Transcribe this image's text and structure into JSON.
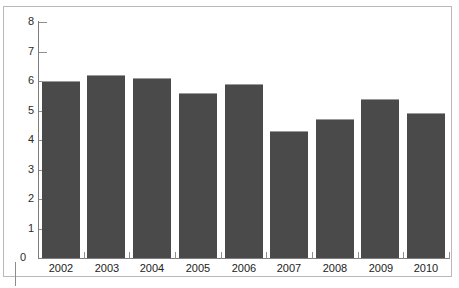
{
  "chart_data": {
    "type": "bar",
    "title": "",
    "subtitle": "",
    "xlabel": "",
    "ylabel": "",
    "categories": [
      "2002",
      "2003",
      "2004",
      "2005",
      "2006",
      "2007",
      "2008",
      "2009",
      "2010"
    ],
    "values": [
      6.0,
      6.2,
      6.1,
      5.6,
      5.9,
      4.3,
      4.7,
      5.4,
      4.9
    ],
    "ylim": [
      0,
      8
    ],
    "ytick_labels": [
      "0",
      "1",
      "2",
      "3",
      "4",
      "5",
      "6",
      "7",
      "8"
    ],
    "ytick_values": [
      0,
      1,
      2,
      3,
      4,
      5,
      6,
      7,
      8
    ],
    "grid": false,
    "legend": null,
    "legend_position": "none",
    "annotations": [],
    "bar_color": "#4a4a4a",
    "axis_color": "#7d7d7d",
    "frame_color": "#b9b9b9",
    "background": "#ffffff"
  },
  "figure": {
    "name": "bar-chart"
  }
}
